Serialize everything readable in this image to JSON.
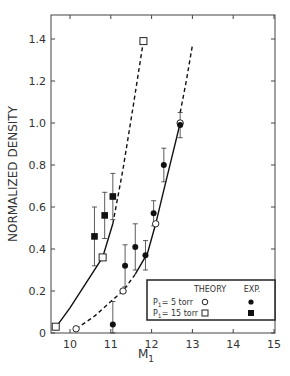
{
  "chart_data": {
    "type": "scatter",
    "title": "",
    "xlabel": "M",
    "xlabel_subscript": "1",
    "ylabel": "NORMALIZED DENSITY",
    "xlim": [
      9.55,
      15
    ],
    "ylim": [
      0,
      1.5
    ],
    "x_ticks": [
      10,
      11,
      12,
      13,
      14,
      15
    ],
    "y_ticks": [
      0,
      0.2,
      0.4,
      0.6,
      0.8,
      1.0,
      1.2,
      1.4
    ],
    "y_tick_labels": [
      "0",
      "0.2",
      "0.4",
      "0.6",
      "0.8",
      "1.0",
      "1.2",
      "1.4"
    ],
    "grid": false,
    "legend_position": "lower right",
    "legend": {
      "header_theory": "THEORY",
      "header_exp": "EXP.",
      "rows": [
        {
          "label": "P",
          "sub": "1",
          "suffix": "= 5 torr",
          "theory_marker": "open-circle",
          "exp_marker": "filled-circle"
        },
        {
          "label": "P",
          "sub": "1",
          "suffix": "= 15 torr",
          "theory_marker": "open-square",
          "exp_marker": "filled-square"
        }
      ]
    },
    "series": [
      {
        "name": "Theory P1 = 5 torr",
        "marker": "open-circle",
        "points": [
          {
            "x": 10.15,
            "y": 0.02
          },
          {
            "x": 11.3,
            "y": 0.2
          },
          {
            "x": 12.1,
            "y": 0.52
          },
          {
            "x": 12.7,
            "y": 1.0
          }
        ]
      },
      {
        "name": "Theory P1 = 15 torr",
        "marker": "open-square",
        "points": [
          {
            "x": 9.65,
            "y": 0.03
          },
          {
            "x": 10.8,
            "y": 0.36
          },
          {
            "x": 11.8,
            "y": 1.39
          }
        ]
      },
      {
        "name": "Exp. P1 = 5 torr",
        "marker": "filled-circle",
        "points": [
          {
            "x": 11.05,
            "y": 0.04,
            "err": 0.11
          },
          {
            "x": 11.35,
            "y": 0.32,
            "err": 0.1
          },
          {
            "x": 11.6,
            "y": 0.41,
            "err": 0.11
          },
          {
            "x": 11.85,
            "y": 0.37,
            "err": 0.07
          },
          {
            "x": 12.05,
            "y": 0.57,
            "err": 0.06
          },
          {
            "x": 12.3,
            "y": 0.8,
            "err": 0.08
          },
          {
            "x": 12.7,
            "y": 0.99,
            "err": 0.06
          }
        ]
      },
      {
        "name": "Exp. P1 = 15 torr",
        "marker": "filled-square",
        "points": [
          {
            "x": 10.6,
            "y": 0.46,
            "err": 0.14
          },
          {
            "x": 10.85,
            "y": 0.56,
            "err": 0.11
          },
          {
            "x": 11.05,
            "y": 0.65,
            "err": 0.11
          }
        ]
      }
    ],
    "curves": [
      {
        "name": "5 torr fit",
        "segments": [
          {
            "style": "dashed",
            "points": [
              [
                10.15,
                0.02
              ],
              [
                10.6,
                0.08
              ],
              [
                11.0,
                0.15
              ],
              [
                11.3,
                0.2
              ],
              [
                11.6,
                0.28
              ]
            ]
          },
          {
            "style": "solid",
            "points": [
              [
                11.6,
                0.28
              ],
              [
                11.9,
                0.38
              ],
              [
                12.1,
                0.52
              ],
              [
                12.3,
                0.68
              ],
              [
                12.5,
                0.84
              ],
              [
                12.7,
                1.0
              ]
            ]
          },
          {
            "style": "dashed",
            "points": [
              [
                12.7,
                1.05
              ],
              [
                12.85,
                1.2
              ],
              [
                13.0,
                1.37
              ]
            ]
          }
        ]
      },
      {
        "name": "15 torr fit",
        "segments": [
          {
            "style": "solid",
            "points": [
              [
                9.7,
                0.04
              ],
              [
                10.0,
                0.12
              ],
              [
                10.4,
                0.24
              ],
              [
                10.8,
                0.36
              ],
              [
                11.05,
                0.52
              ]
            ]
          },
          {
            "style": "dashed",
            "points": [
              [
                11.05,
                0.52
              ],
              [
                11.3,
                0.78
              ],
              [
                11.55,
                1.08
              ],
              [
                11.8,
                1.39
              ]
            ]
          }
        ]
      }
    ]
  }
}
